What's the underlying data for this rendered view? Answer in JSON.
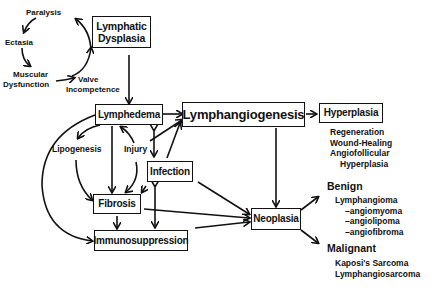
{
  "cycle": {
    "paralysis": "Paralysis",
    "ectasia": "Ectasia",
    "muscular_dysfunction": [
      "Muscular",
      "Dysfunction"
    ],
    "valve_incompetence": [
      "Valve",
      "Incompetence"
    ]
  },
  "boxes": {
    "lymphatic_dysplasia": [
      "Lymphatic",
      "Dysplasia"
    ],
    "lymphedema": "Lymphedema",
    "lymphangiogenesis": "Lymphangiogenesis",
    "hyperplasia": "Hyperplasia",
    "infection": "Infection",
    "fibrosis": "Fibrosis",
    "immunosuppression": "Immunosuppression",
    "neoplasia": "Neoplasia"
  },
  "labels": {
    "lipogenesis": "Lipogenesis",
    "injury": "Injury"
  },
  "hyperplasia_types": [
    "Regeneration",
    "Wound-Healing",
    "Angiofollicular",
    "Hyperplasia"
  ],
  "benign": {
    "title": "Benign",
    "items": [
      "Lymphangioma",
      "–angiomyoma",
      "–angiolipoma",
      "–angiofibroma"
    ]
  },
  "malignant": {
    "title": "Malignant",
    "items": [
      "Kaposi's Sarcoma",
      "Lymphangiosarcoma"
    ]
  }
}
